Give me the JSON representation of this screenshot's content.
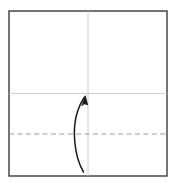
{
  "canvas": {
    "width": 178,
    "height": 186,
    "background": "#ffffff",
    "title": "origami-fold-step"
  },
  "diagram": {
    "type": "origami-fold-step",
    "paper": {
      "name": "square-paper",
      "shape": "square",
      "x": 9,
      "y": 11,
      "width": 158,
      "height": 165,
      "stroke": "#3c3c3c",
      "stroke_width": 1.4,
      "fill": "#ffffff"
    },
    "creases": [
      {
        "name": "vertical-center-crease",
        "orientation": "vertical",
        "x1": 88,
        "y1": 11,
        "x2": 88,
        "y2": 176,
        "style": "solid",
        "stroke": "#c8c8c8",
        "stroke_width": 0.9
      },
      {
        "name": "horizontal-center-crease",
        "orientation": "horizontal",
        "x1": 9,
        "y1": 93.5,
        "x2": 167,
        "y2": 93.5,
        "style": "solid",
        "stroke": "#c8c8c8",
        "stroke_width": 0.9
      }
    ],
    "fold_lines": [
      {
        "name": "valley-fold-line",
        "orientation": "horizontal",
        "x1": 9,
        "y1": 134,
        "x2": 167,
        "y2": 134,
        "style": "dashed",
        "dash_length": 5,
        "gap_length": 3.4,
        "stroke": "#9a9a9a",
        "stroke_width": 1.2
      }
    ],
    "arrow": {
      "name": "fold-direction-arrow",
      "direction": "upward-curved",
      "path": "M 83.5 172 C 74 156 71.5 128 78 110 C 80 104 82.5 100 84.5 97",
      "stroke": "#1a1a1a",
      "stroke_width": 1.5,
      "head": {
        "name": "arrowhead",
        "points": "85.5 95, 81.0 106.5, 84.4 104.2, 88.2 105.2",
        "fill": "#1a1a1a"
      }
    }
  },
  "colors": {
    "paper_outline": "#3c3c3c",
    "crease": "#c8c8c8",
    "fold_dash": "#9a9a9a",
    "arrow": "#1a1a1a",
    "background": "#ffffff"
  }
}
